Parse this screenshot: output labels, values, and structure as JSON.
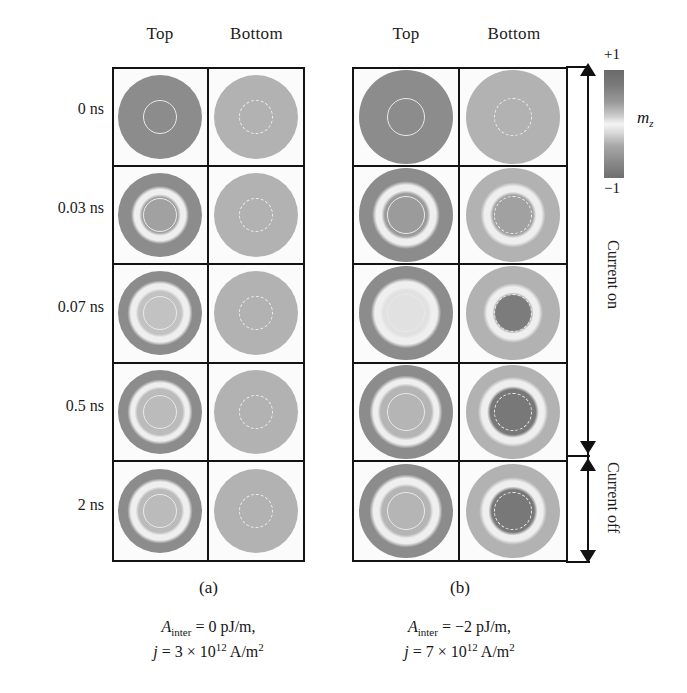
{
  "figure": {
    "column_headers": [
      "Top",
      "Bottom"
    ],
    "row_labels": [
      "0 ns",
      "0.03 ns",
      "0.07 ns",
      "0.5 ns",
      "2 ns"
    ],
    "panels": [
      {
        "id": "a",
        "label": "(a)",
        "caption_line1_symbol": "A",
        "caption_line1_sub": "inter",
        "caption_line1_rest": " = 0 pJ/m,",
        "caption_line2_symbol": "j",
        "caption_line2_rest": " = 3 × 10",
        "caption_line2_exp": "12",
        "caption_line2_unit": " A/m",
        "caption_line2_unit_exp": "2"
      },
      {
        "id": "b",
        "label": "(b)",
        "caption_line1_symbol": "A",
        "caption_line1_sub": "inter",
        "caption_line1_rest": " = −2 pJ/m,",
        "caption_line2_symbol": "j",
        "caption_line2_rest": " = 7 × 10",
        "caption_line2_exp": "12",
        "caption_line2_unit": " A/m",
        "caption_line2_unit_exp": "2"
      }
    ],
    "colorbar": {
      "max_label": "+1",
      "min_label": "−1",
      "quantity_symbol": "m",
      "quantity_sub": "z",
      "dark_hex": "#6a6a6a",
      "light_hex": "#f4f4f4"
    },
    "current_bracket": {
      "on_label": "Current on",
      "off_label": "Current off"
    }
  },
  "chart_data": {
    "type": "heatmap",
    "title": "",
    "xlabel": "",
    "ylabel": "",
    "colorbar_range": [
      -1,
      1
    ],
    "colorbar_label": "m_z",
    "time_steps": [
      "0 ns",
      "0.03 ns",
      "0.07 ns",
      "0.5 ns",
      "2 ns"
    ],
    "layers": [
      "Top",
      "Bottom"
    ],
    "panels": [
      {
        "id": "a",
        "A_inter_pJ_per_m": 0,
        "current_density_A_per_m2": 3000000000000.0,
        "cells": [
          {
            "time": "0 ns",
            "layer": "Top",
            "base": 0.72,
            "ring": "solid",
            "core": 0.72,
            "core_r": 0.0,
            "halo": 0.0
          },
          {
            "time": "0 ns",
            "layer": "Bottom",
            "base": 0.42,
            "ring": "dashed",
            "core": 0.42,
            "core_r": 0.0,
            "halo": 0.0
          },
          {
            "time": "0.03 ns",
            "layer": "Top",
            "base": 0.72,
            "ring": "solid",
            "core": -0.55,
            "core_r": 0.34,
            "halo": 0.25
          },
          {
            "time": "0.03 ns",
            "layer": "Bottom",
            "base": 0.42,
            "ring": "dashed",
            "core": 0.42,
            "core_r": 0.0,
            "halo": 0.0
          },
          {
            "time": "0.07 ns",
            "layer": "Top",
            "base": 0.72,
            "ring": "solid",
            "core": 0.3,
            "core_r": 0.4,
            "halo": 0.7
          },
          {
            "time": "0.07 ns",
            "layer": "Bottom",
            "base": 0.42,
            "ring": "dashed",
            "core": 0.42,
            "core_r": 0.0,
            "halo": 0.0
          },
          {
            "time": "0.5 ns",
            "layer": "Top",
            "base": 0.72,
            "ring": "solid",
            "core": 0.35,
            "core_r": 0.42,
            "halo": 0.8
          },
          {
            "time": "0.5 ns",
            "layer": "Bottom",
            "base": 0.42,
            "ring": "dashed",
            "core": 0.42,
            "core_r": 0.0,
            "halo": 0.0
          },
          {
            "time": "2 ns",
            "layer": "Top",
            "base": 0.72,
            "ring": "solid",
            "core": 0.35,
            "core_r": 0.4,
            "halo": 0.8
          },
          {
            "time": "2 ns",
            "layer": "Bottom",
            "base": 0.42,
            "ring": "dashed",
            "core": 0.42,
            "core_r": 0.0,
            "halo": 0.0
          }
        ]
      },
      {
        "id": "b",
        "A_inter_pJ_per_m": -2,
        "current_density_A_per_m2": 7000000000000.0,
        "cells": [
          {
            "time": "0 ns",
            "layer": "Top",
            "base": 0.72,
            "ring": "solid",
            "core": 0.72,
            "core_r": 0.0,
            "halo": 0.0
          },
          {
            "time": "0 ns",
            "layer": "Bottom",
            "base": 0.42,
            "ring": "dashed",
            "core": 0.42,
            "core_r": 0.0,
            "halo": 0.0
          },
          {
            "time": "0.03 ns",
            "layer": "Top",
            "base": 0.72,
            "ring": "solid",
            "core": -0.6,
            "core_r": 0.36,
            "halo": 0.35
          },
          {
            "time": "0.03 ns",
            "layer": "Bottom",
            "base": 0.42,
            "ring": "dashed",
            "core": -0.55,
            "core_r": 0.34,
            "halo": 0.35
          },
          {
            "time": "0.07 ns",
            "layer": "Top",
            "base": 0.72,
            "ring": "solid",
            "core": 0.1,
            "core_r": 0.38,
            "halo": 0.75
          },
          {
            "time": "0.07 ns",
            "layer": "Bottom",
            "base": 0.42,
            "ring": "dashed",
            "core": 0.85,
            "core_r": 0.3,
            "halo": 0.7
          },
          {
            "time": "0.5 ns",
            "layer": "Top",
            "base": 0.72,
            "ring": "solid",
            "core": 0.4,
            "core_r": 0.42,
            "halo": 0.85
          },
          {
            "time": "0.5 ns",
            "layer": "Bottom",
            "base": 0.42,
            "ring": "dashed",
            "core": 0.88,
            "core_r": 0.38,
            "halo": 0.8
          },
          {
            "time": "2 ns",
            "layer": "Top",
            "base": 0.72,
            "ring": "solid",
            "core": 0.4,
            "core_r": 0.4,
            "halo": 0.85
          },
          {
            "time": "2 ns",
            "layer": "Bottom",
            "base": 0.42,
            "ring": "dashed",
            "core": 0.88,
            "core_r": 0.36,
            "halo": 0.8
          }
        ]
      }
    ]
  }
}
